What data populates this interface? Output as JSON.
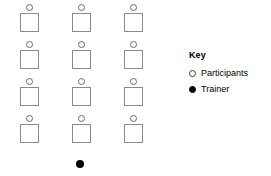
{
  "diagram": {
    "type": "seating-layout",
    "grid": {
      "columns": 3,
      "rows": 4,
      "column_x": [
        19,
        71,
        123
      ],
      "row_y": [
        4,
        41,
        78,
        115
      ],
      "seat_symbol": "open-circle",
      "desk_symbol": "square",
      "seats": [
        {
          "row": 1,
          "column": 1,
          "person": "open-circle",
          "desk": "square"
        },
        {
          "row": 1,
          "column": 2,
          "person": "open-circle",
          "desk": "square"
        },
        {
          "row": 1,
          "column": 3,
          "person": "open-circle",
          "desk": "square"
        },
        {
          "row": 2,
          "column": 1,
          "person": "open-circle",
          "desk": "square"
        },
        {
          "row": 2,
          "column": 2,
          "person": "open-circle",
          "desk": "square"
        },
        {
          "row": 2,
          "column": 3,
          "person": "open-circle",
          "desk": "square"
        },
        {
          "row": 3,
          "column": 1,
          "person": "open-circle",
          "desk": "square"
        },
        {
          "row": 3,
          "column": 2,
          "person": "open-circle",
          "desk": "square"
        },
        {
          "row": 3,
          "column": 3,
          "person": "open-circle",
          "desk": "square"
        },
        {
          "row": 4,
          "column": 1,
          "person": "open-circle",
          "desk": "square"
        },
        {
          "row": 4,
          "column": 2,
          "person": "open-circle",
          "desk": "square"
        },
        {
          "row": 4,
          "column": 3,
          "person": "open-circle",
          "desk": "square"
        }
      ]
    },
    "trainer": {
      "symbol": "filled-circle",
      "x": 80,
      "y": 164
    },
    "colors": {
      "desk_outline": "#8a8a8a",
      "participant_outline": "#6b6b6b",
      "trainer_fill": "#000000",
      "background": "#ffffff",
      "text": "#000000"
    }
  },
  "key": {
    "title": "Key",
    "items": [
      {
        "symbol": "open-circle",
        "label": "Participants"
      },
      {
        "symbol": "filled-circle",
        "label": "Trainer"
      }
    ]
  }
}
